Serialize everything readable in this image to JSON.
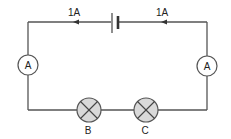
{
  "diagram": {
    "type": "series-circuit",
    "colors": {
      "wire": "#555555",
      "lamp_fill": "#d9d9d9",
      "text": "#222222"
    },
    "current_labels": [
      {
        "text": "1A",
        "position": "top-left"
      },
      {
        "text": "1A",
        "position": "top-right"
      }
    ],
    "components": {
      "cell": {
        "symbol": "battery-cell"
      },
      "ammeters": [
        {
          "label": "A",
          "position": "left"
        },
        {
          "label": "A",
          "position": "right"
        }
      ],
      "lamps": [
        {
          "label": "B"
        },
        {
          "label": "C"
        }
      ]
    }
  }
}
